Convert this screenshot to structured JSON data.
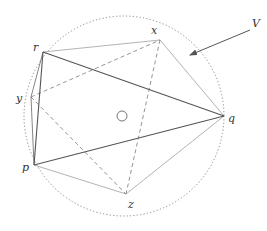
{
  "diagram": {
    "circle": {
      "cx": 124,
      "cy": 116,
      "r": 100,
      "style": "dotted",
      "color": "#888888"
    },
    "center_marker": {
      "cx": 122,
      "cy": 116,
      "r": 5
    },
    "points": {
      "r": {
        "x": 43,
        "y": 52,
        "label": "r",
        "lx": 33,
        "ly": 42
      },
      "x": {
        "x": 160,
        "y": 40,
        "label": "x",
        "lx": 151,
        "ly": 25
      },
      "q": {
        "x": 224,
        "y": 116,
        "label": "q",
        "lx": 228,
        "ly": 113
      },
      "z": {
        "x": 126,
        "y": 194,
        "label": "z",
        "lx": 128,
        "ly": 199
      },
      "p": {
        "x": 34,
        "y": 165,
        "label": "p",
        "lx": 22,
        "ly": 162
      },
      "y": {
        "x": 31,
        "y": 97,
        "label": "y",
        "lx": 16,
        "ly": 93
      }
    },
    "edges_dark": [
      [
        "r",
        "q"
      ],
      [
        "p",
        "q"
      ],
      [
        "r",
        "p"
      ]
    ],
    "edges_gray": [
      [
        "r",
        "y"
      ],
      [
        "y",
        "p"
      ]
    ],
    "edges_light": [
      [
        "r",
        "x"
      ],
      [
        "x",
        "q"
      ],
      [
        "q",
        "z"
      ],
      [
        "p",
        "z"
      ]
    ],
    "edges_dashed": [
      [
        "y",
        "x"
      ],
      [
        "x",
        "z"
      ],
      [
        "y",
        "z"
      ]
    ],
    "arrow": {
      "x1": 250,
      "y1": 30,
      "x2": 190,
      "y2": 55,
      "label": "V",
      "lx": 252,
      "ly": 18
    },
    "colors": {
      "dark": "#555555",
      "gray": "#777777",
      "light": "#aaaaaa",
      "dashed": "#888888"
    }
  }
}
